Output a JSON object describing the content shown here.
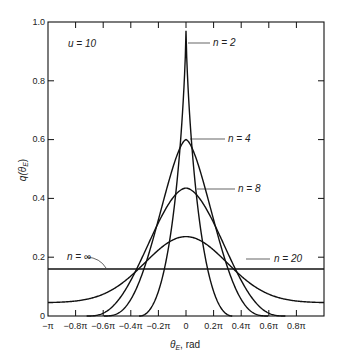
{
  "chart_data": {
    "type": "line",
    "title": "",
    "xlabel": "θ_E, rad",
    "ylabel": "q(θ_E)",
    "xlim": [
      -3.14159,
      3.14159
    ],
    "ylim": [
      0,
      1.0
    ],
    "grid": false,
    "legend": "inline labels with leader lines",
    "annotation": "u = 10",
    "x_ticks": [
      "−π",
      "−0.8π",
      "−0.6π",
      "−0.4π",
      "−0.2π",
      "0",
      "0.2π",
      "0.4π",
      "0.6π",
      "0.8π"
    ],
    "y_ticks": [
      "0",
      "0.2",
      "0.4",
      "0.6",
      "0.8",
      "1.0"
    ],
    "series": [
      {
        "name": "n = 2",
        "peak": 0.97,
        "x_zero_at": [
          -0.33,
          0.33
        ],
        "shape": "sharp peak at 0"
      },
      {
        "name": "n = 4",
        "peak": 0.6,
        "x_zero_at": [
          -0.6,
          0.6
        ],
        "shape": "rounded peak at 0"
      },
      {
        "name": "n = 8",
        "peak": 0.435,
        "x_zero_at": [
          -0.7,
          0.7
        ],
        "shape": "rounded peak at 0"
      },
      {
        "name": "n = 20",
        "peak": 0.27,
        "value_at_edges": 0.045,
        "shape": "broad peak at 0"
      },
      {
        "name": "n = ∞",
        "value": 0.16,
        "shape": "flat horizontal line"
      }
    ]
  },
  "labels": {
    "u": "u = 10",
    "n2": "n = 2",
    "n4": "n = 4",
    "n8": "n = 8",
    "n20": "n = 20",
    "ninf": "n = ∞",
    "xlabel_theta": "θ",
    "xlabel_sub": "E",
    "xlabel_unit": ", rad",
    "ylabel_q": "q(θ",
    "ylabel_sub": "E",
    "ylabel_close": ")"
  }
}
